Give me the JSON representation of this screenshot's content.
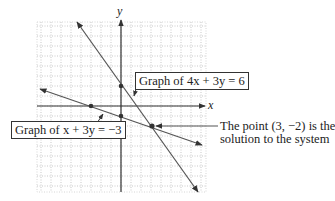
{
  "diagram": {
    "axes": {
      "x_label": "x",
      "y_label": "y"
    },
    "grid": {
      "x_min": -8.5,
      "x_max": 8.5,
      "y_min": -8.6,
      "y_max": 8.4,
      "unit_px": 10,
      "origin_px": [
        121,
        106
      ]
    },
    "lines": [
      {
        "equation": "4x + 3y = 6",
        "label_prefix": "Graph of ",
        "label_eq": "4x + 3y = 6",
        "points": [
          [
            0,
            2
          ]
        ]
      },
      {
        "equation": "x + 3y = -3",
        "label_prefix": "Graph of ",
        "label_eq": "x + 3y = −3",
        "points": [
          [
            -3,
            0
          ],
          [
            0,
            -1
          ]
        ]
      }
    ],
    "solution": {
      "point": [
        3,
        -2
      ],
      "note_line1": "The point (3, −2) is the",
      "note_line2": "solution to the system"
    },
    "colors": {
      "line": "#555555",
      "grid": "#bbbbbb",
      "axis": "#333333",
      "dot": "#333333"
    }
  }
}
